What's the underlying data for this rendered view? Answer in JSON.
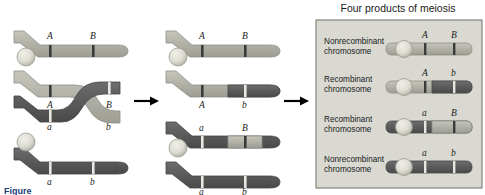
{
  "figure": {
    "domain_label": "meiotic-recombination-diagram",
    "caption_partial": "Figure",
    "background": "#ffffff"
  },
  "colors": {
    "light_chromatid": "#b5b5ad",
    "light_chromatid_edge": "#8e8e86",
    "dark_chromatid": "#5e5e5e",
    "dark_chromatid_edge": "#454545",
    "centromere": "#d8d8cf",
    "centromere_edge": "#9a9a90",
    "marker_dark": "#3a3a3a",
    "marker_light": "#e8e8e2",
    "panel_bg": "#d9d9d2",
    "panel_border": "#7a7a72",
    "arrow": "#000000",
    "text": "#1a1a1a"
  },
  "stages": {
    "left": {
      "name": "crossover-chiasma-stage",
      "top_labels": [
        "A",
        "B"
      ],
      "mid_labels": [
        "A",
        "B"
      ],
      "lower_labels": [
        "a",
        "b"
      ],
      "bottom_labels": [
        "a",
        "b"
      ]
    },
    "middle": {
      "name": "post-crossover-stage",
      "top_labels": [
        "A",
        "B"
      ],
      "mid_labels": [
        "A",
        "b"
      ],
      "lower_labels": [
        "a",
        "B"
      ],
      "bottom_labels": [
        "a",
        "b"
      ]
    }
  },
  "arrows": [
    {
      "name": "arrow-stage-one-to-two"
    },
    {
      "name": "arrow-stage-two-to-products"
    }
  ],
  "products_panel": {
    "title": "Four products of meiosis",
    "rows": [
      {
        "label_line1": "Nonrecombinant",
        "label_line2": "chromosome",
        "left_allele": "A",
        "right_allele": "B",
        "left_arm_shade": "light",
        "right_arm_shade": "light"
      },
      {
        "label_line1": "Recombinant",
        "label_line2": "chromosome",
        "left_allele": "A",
        "right_allele": "b",
        "left_arm_shade": "light",
        "right_arm_shade": "dark"
      },
      {
        "label_line1": "Recombinant",
        "label_line2": "chromosome",
        "left_allele": "a",
        "right_allele": "B",
        "left_arm_shade": "dark",
        "right_arm_shade": "light"
      },
      {
        "label_line1": "Nonrecombinant",
        "label_line2": "chromosome",
        "left_allele": "a",
        "right_allele": "b",
        "left_arm_shade": "dark",
        "right_arm_shade": "dark"
      }
    ]
  }
}
